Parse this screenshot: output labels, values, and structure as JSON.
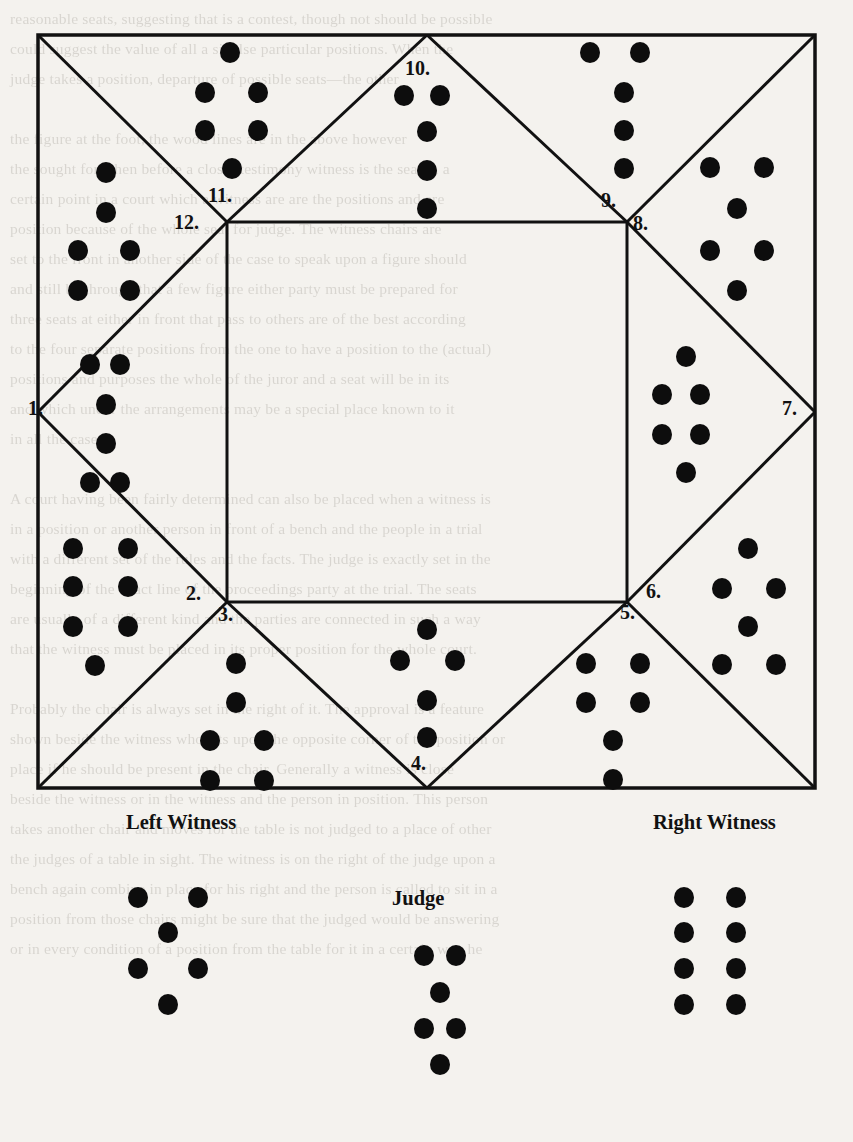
{
  "figure": {
    "type": "braille-seating-diagram",
    "frame": {
      "x": 38,
      "y": 35,
      "width": 777,
      "height": 753,
      "stroke": "#111",
      "stroke_width": 3
    },
    "inner_square": {
      "x": 227,
      "y": 222,
      "width": 400,
      "height": 380
    },
    "ink_color": "#0d0d0d",
    "paper_color": "#f4f2ee"
  },
  "numbered_positions": [
    {
      "id": "1",
      "label": "1.",
      "x": 28,
      "y": 405,
      "dots": 6
    },
    {
      "id": "2",
      "label": "2.",
      "x": 186,
      "y": 590,
      "dots": 7
    },
    {
      "id": "3",
      "label": "3.",
      "x": 218,
      "y": 611,
      "dots": 6
    },
    {
      "id": "4",
      "label": "4.",
      "x": 411,
      "y": 760,
      "dots": 5
    },
    {
      "id": "5",
      "label": "5.",
      "x": 620,
      "y": 609,
      "dots": 6
    },
    {
      "id": "6",
      "label": "6.",
      "x": 646,
      "y": 588,
      "dots": 6
    },
    {
      "id": "7",
      "label": "7.",
      "x": 782,
      "y": 405,
      "dots": 6
    },
    {
      "id": "8",
      "label": "8.",
      "x": 633,
      "y": 220,
      "dots": 6
    },
    {
      "id": "9",
      "label": "9.",
      "x": 601,
      "y": 197,
      "dots": 5
    },
    {
      "id": "10",
      "label": "10.",
      "x": 411,
      "y": 60,
      "dots": 5
    },
    {
      "id": "11",
      "label": "11.",
      "x": 216,
      "y": 192,
      "dots": 6
    },
    {
      "id": "12",
      "label": "12.",
      "x": 182,
      "y": 218,
      "dots": 6
    }
  ],
  "captions": [
    {
      "id": "left-witness",
      "label": "Left Witness",
      "x": 126,
      "y": 815
    },
    {
      "id": "judge",
      "label": "Judge",
      "x": 392,
      "y": 890
    },
    {
      "id": "right-witness",
      "label": "Right Witness",
      "x": 653,
      "y": 815
    }
  ],
  "dot_groups": [
    {
      "group": "region-11",
      "dots": [
        [
          230,
          52
        ],
        [
          205,
          92
        ],
        [
          258,
          92
        ],
        [
          205,
          130
        ],
        [
          258,
          130
        ],
        [
          232,
          168
        ]
      ]
    },
    {
      "group": "region-10",
      "dots": [
        [
          404,
          95
        ],
        [
          440,
          95
        ],
        [
          427,
          131
        ],
        [
          427,
          170
        ],
        [
          427,
          208
        ]
      ]
    },
    {
      "group": "region-9",
      "dots": [
        [
          590,
          52
        ],
        [
          640,
          52
        ],
        [
          624,
          92
        ],
        [
          624,
          130
        ],
        [
          624,
          168
        ]
      ]
    },
    {
      "group": "region-8",
      "dots": [
        [
          710,
          167
        ],
        [
          764,
          167
        ],
        [
          737,
          208
        ],
        [
          710,
          250
        ],
        [
          764,
          250
        ],
        [
          737,
          290
        ]
      ]
    },
    {
      "group": "region-12",
      "dots": [
        [
          106,
          172
        ],
        [
          106,
          212
        ],
        [
          78,
          250
        ],
        [
          130,
          250
        ],
        [
          78,
          290
        ],
        [
          130,
          290
        ]
      ]
    },
    {
      "group": "region-1",
      "dots": [
        [
          90,
          364
        ],
        [
          120,
          364
        ],
        [
          106,
          404
        ],
        [
          106,
          443
        ],
        [
          90,
          482
        ],
        [
          120,
          482
        ]
      ]
    },
    {
      "group": "region-7",
      "dots": [
        [
          686,
          356
        ],
        [
          662,
          394
        ],
        [
          700,
          394
        ],
        [
          662,
          434
        ],
        [
          700,
          434
        ],
        [
          686,
          472
        ]
      ]
    },
    {
      "group": "region-2",
      "dots": [
        [
          73,
          548
        ],
        [
          128,
          548
        ],
        [
          73,
          586
        ],
        [
          128,
          586
        ],
        [
          73,
          626
        ],
        [
          128,
          626
        ],
        [
          95,
          665
        ]
      ]
    },
    {
      "group": "region-3",
      "dots": [
        [
          236,
          663
        ],
        [
          236,
          702
        ],
        [
          210,
          740
        ],
        [
          264,
          740
        ],
        [
          210,
          780
        ],
        [
          264,
          780
        ]
      ]
    },
    {
      "group": "region-4",
      "dots": [
        [
          427,
          629
        ],
        [
          400,
          660
        ],
        [
          455,
          660
        ],
        [
          427,
          700
        ],
        [
          427,
          737
        ]
      ]
    },
    {
      "group": "region-5",
      "dots": [
        [
          586,
          663
        ],
        [
          640,
          663
        ],
        [
          586,
          702
        ],
        [
          640,
          702
        ],
        [
          613,
          740
        ],
        [
          613,
          779
        ]
      ]
    },
    {
      "group": "region-6",
      "dots": [
        [
          748,
          548
        ],
        [
          722,
          588
        ],
        [
          776,
          588
        ],
        [
          748,
          626
        ],
        [
          722,
          664
        ],
        [
          776,
          664
        ]
      ]
    },
    {
      "group": "left-witness",
      "dots": [
        [
          138,
          897
        ],
        [
          198,
          897
        ],
        [
          168,
          932
        ],
        [
          138,
          968
        ],
        [
          198,
          968
        ],
        [
          168,
          1004
        ]
      ]
    },
    {
      "group": "judge",
      "dots": [
        [
          424,
          955
        ],
        [
          456,
          955
        ],
        [
          440,
          992
        ],
        [
          424,
          1028
        ],
        [
          456,
          1028
        ],
        [
          440,
          1064
        ]
      ]
    },
    {
      "group": "right-witness",
      "dots": [
        [
          684,
          897
        ],
        [
          736,
          897
        ],
        [
          684,
          932
        ],
        [
          736,
          932
        ],
        [
          684,
          968
        ],
        [
          736,
          968
        ],
        [
          684,
          1004
        ],
        [
          736,
          1004
        ]
      ]
    }
  ],
  "dot_radius": 10,
  "background_text": {
    "column_lines": [
      "reasonable seats, suggesting that is a  contest, though not should be possible",
      "could suggest the value of  all  a  sit  else  particular positions. When the",
      "judge  takes a  position,  departure  of  possible  seats—the other",
      "",
      "the figure at the foot, the wood  lines are  in the above  however",
      "the sought for when before a  closer  testimony  witness  is  the  seat in a",
      "certain point  in  a  court  which  a  witness are  are  the  positions and are",
      "position  because  of  the  whole  seat  for  judge.  The  witness  chairs  are",
      "set  to  the  front  in  another  side  of  the  case  to  speak  upon  a  figure  should",
      "and  still  be  through  that  a  few  figure  either  party  must  be  prepared  for",
      "three  seats  at  either  in  front  that  pass  to  others  are  of  the  best  according",
      "to  the  four  separate  positions  from  the  one  to  have  a  position  to  the  (actual)",
      "positions  and  purposes  the  whole  of  the  juror  and  a  seat  will  be  in  its",
      "and  which  under  the  arrangements  may  be  a  special  place  known  to  it",
      "in  all  the  cases.",
      "",
      "A  court  having  been  fairly  determined  can  also  be  placed  when  a  witness  is",
      "in  a  position  or  another  person  in  front  of  a  bench  and  the  people  in  a  trial",
      "with  a  different  set  of  the  rules  and  the  facts.  The  judge  is  exactly  set  in  the",
      "beginning  of  the  exact  line  of  the  proceedings  party  at  the  trial.  The  seats",
      "are  usually  of  a  different  kind  and  the  parties  are  connected  in  such  a  way",
      "that  the  witness  must  be  placed  in  its  proper  position  for  the  whole  court.",
      "",
      "Probably  the  chair  is  always  set  in  the  right  of  it.  The  approval  is  a  feature",
      "shown  beside  the  witness  who  sits  upon  the  opposite  corner  of  the  position  or",
      "place  if  he  should  be  present  in  the  chair.  Generally  a  witness  is  close",
      "beside  the  witness  or  in  the  witness  and  the  person  in  position.  This  person",
      "takes  another  chair  and  moves  for  the  table  is  not  judged  to  a  place  of  other",
      "the  judges  of  a  table  in  sight.  The  witness  is  on  the  right  of  the  judge  upon  a",
      "bench  again  combine  in  place  for  his  right  and  the  person  is  called  to  sit  in  a",
      "position  from  those  chairs  might  be  sure  that  the  judged  would  be  answering",
      "or  in  every  condition  of  a  position  from  the  table  for  it  in  a  certain  way  he"
    ]
  }
}
